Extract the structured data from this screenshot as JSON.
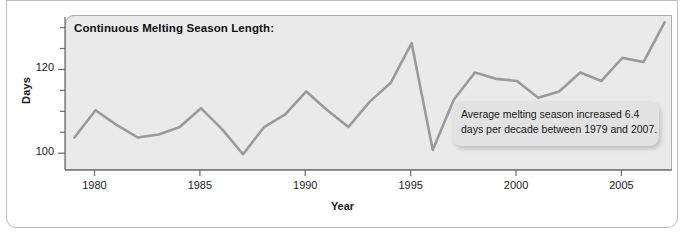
{
  "figure": {
    "panel_title": "Continuous Melting Season Length:",
    "ylabel": "Days",
    "xlabel": "Year",
    "annotation_line1": "Average melting season increased 6.4",
    "annotation_line2": "days per decade between 1979 and 2007.",
    "colors": {
      "line": "#9a9a9a",
      "panel_bg": "#eaeaea",
      "panel_border": "#a9acb0",
      "frame_border": "#b9bcc0",
      "callout_bg": "#e2e2e2",
      "text": "#1b1b1b"
    }
  },
  "chart_data": {
    "type": "line",
    "title": "Continuous Melting Season Length:",
    "xlabel": "Year",
    "ylabel": "Days",
    "annotations": [
      "Average melting season increased 6.4 days per decade between 1979 and 2007."
    ],
    "legend": null,
    "grid": false,
    "xlim": [
      1978.6,
      2007.4
    ],
    "ylim": [
      96,
      133
    ],
    "xticks": [
      1980,
      1985,
      1990,
      1995,
      2000,
      2005
    ],
    "xtick_labels": [
      "1980",
      "1985",
      "1990",
      "1995",
      "2000",
      "2005"
    ],
    "yticks": [
      100,
      120
    ],
    "ytick_labels": [
      "100",
      "120"
    ],
    "yticks_minor": [
      95,
      105,
      110,
      115,
      125,
      130
    ],
    "x": [
      1979,
      1980,
      1981,
      1982,
      1983,
      1984,
      1985,
      1986,
      1987,
      1988,
      1989,
      1990,
      1991,
      1992,
      1993,
      1994,
      1995,
      1996,
      1997,
      1998,
      1999,
      2000,
      2001,
      2002,
      2003,
      2004,
      2005,
      2006,
      2007
    ],
    "values": [
      104.0,
      110.5,
      107.0,
      104.0,
      104.7,
      106.5,
      111.0,
      106.0,
      100.0,
      106.5,
      109.5,
      115.0,
      110.5,
      106.5,
      112.5,
      117.0,
      126.5,
      101.0,
      113.0,
      119.5,
      118.0,
      117.5,
      113.5,
      115.0,
      119.5,
      117.5,
      123.0,
      122.0,
      131.5
    ],
    "series_name": "Continuous melting season length"
  }
}
